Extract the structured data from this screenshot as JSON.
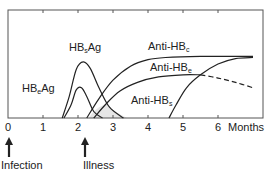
{
  "chart_data": {
    "type": "line",
    "title": "",
    "xlabel": "Months",
    "ylabel": "",
    "xlim": [
      0,
      7
    ],
    "x_ticks": [
      "0",
      "1",
      "2",
      "3",
      "4",
      "5",
      "6"
    ],
    "grid": false,
    "series": [
      {
        "name": "HBeAg",
        "label_main": "HB",
        "label_sub": "e",
        "label_tail": "Ag",
        "points": [
          [
            1.6,
            0
          ],
          [
            1.8,
            0.12
          ],
          [
            1.95,
            0.26
          ],
          [
            2.1,
            0.28
          ],
          [
            2.25,
            0.2
          ],
          [
            2.45,
            0.06
          ],
          [
            2.7,
            0
          ]
        ]
      },
      {
        "name": "HBsAg",
        "label_main": "HB",
        "label_sub": "s",
        "label_tail": "Ag",
        "points": [
          [
            1.55,
            0
          ],
          [
            1.75,
            0.2
          ],
          [
            1.95,
            0.45
          ],
          [
            2.15,
            0.52
          ],
          [
            2.35,
            0.46
          ],
          [
            2.6,
            0.28
          ],
          [
            2.9,
            0.1
          ],
          [
            3.3,
            0
          ]
        ]
      },
      {
        "name": "Anti-HBc",
        "label_main": "Anti-HB",
        "label_sub": "c",
        "label_tail": "",
        "points": [
          [
            2.25,
            0
          ],
          [
            2.6,
            0.18
          ],
          [
            3.0,
            0.35
          ],
          [
            3.5,
            0.48
          ],
          [
            4.0,
            0.54
          ],
          [
            4.5,
            0.56
          ],
          [
            5.5,
            0.57
          ],
          [
            7.0,
            0.57
          ]
        ]
      },
      {
        "name": "Anti-HBe",
        "label_main": "Anti-HB",
        "label_sub": "e",
        "label_tail": "",
        "points": [
          [
            2.45,
            0
          ],
          [
            2.8,
            0.13
          ],
          [
            3.2,
            0.25
          ],
          [
            3.7,
            0.33
          ],
          [
            4.3,
            0.38
          ],
          [
            5.0,
            0.4
          ],
          [
            5.5,
            0.4
          ]
        ],
        "dashed_tail": [
          [
            5.5,
            0.4
          ],
          [
            6.0,
            0.37
          ],
          [
            6.5,
            0.33
          ],
          [
            7.0,
            0.28
          ]
        ]
      },
      {
        "name": "Anti-HBs",
        "label_main": "Anti-HB",
        "label_sub": "s",
        "label_tail": "",
        "points": [
          [
            4.6,
            0
          ],
          [
            4.8,
            0.12
          ],
          [
            5.1,
            0.28
          ],
          [
            5.5,
            0.4
          ],
          [
            6.0,
            0.5
          ],
          [
            6.5,
            0.55
          ],
          [
            7.0,
            0.56
          ]
        ]
      }
    ],
    "shaded_region": {
      "x": [
        2.3,
        3.4
      ],
      "color": "#e6e6e6"
    },
    "annotations": [
      {
        "text": "Infection",
        "x": 0,
        "arrow": "up"
      },
      {
        "text": "Illness",
        "x": 2.2,
        "arrow": "up"
      }
    ]
  },
  "labels": {
    "x_axis_unit": "Months",
    "infection": "Infection",
    "illness": "Illness"
  }
}
